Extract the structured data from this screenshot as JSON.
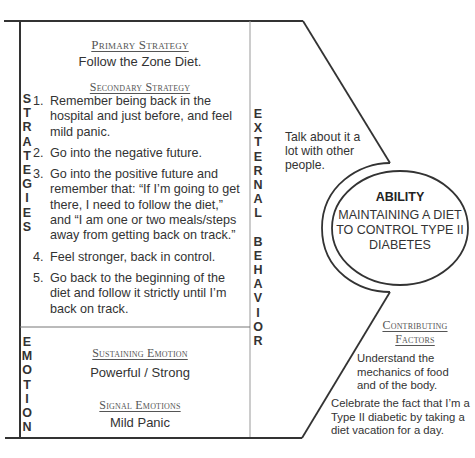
{
  "strategies": {
    "side_label": [
      "S",
      "T",
      "R",
      "A",
      "T",
      "E",
      "G",
      "I",
      "E",
      "S"
    ],
    "primary": {
      "heading": "Primary Strategy",
      "text": "Follow the Zone Diet."
    },
    "secondary": {
      "heading": "Secondary Strategy",
      "steps": [
        {
          "num": "1.",
          "text": "Remember being back in the hospital and just before, and feel mild panic."
        },
        {
          "num": "2.",
          "text": "Go into the negative future."
        },
        {
          "num": "3.",
          "text": "Go into the positive future and remember that: “If I’m going to get there, I need to follow the diet,” and “I am one or two meals/steps away from getting back on track.”"
        },
        {
          "num": "4.",
          "text": "Feel stronger, back in control."
        },
        {
          "num": "5.",
          "text": "Go back to the beginning of the diet and  follow it strictly until I’m back on track."
        }
      ]
    }
  },
  "emotion": {
    "side_label": [
      "E",
      "M",
      "O",
      "T",
      "I",
      "O",
      "N"
    ],
    "sustaining": {
      "heading": "Sustaining Emotion",
      "text": "Powerful / Strong"
    },
    "signal": {
      "heading": "Signal Emotions",
      "text": "Mild Panic"
    }
  },
  "external_behavior": {
    "side_label": [
      "E",
      "X",
      "T",
      "E",
      "R",
      "N",
      "A",
      "L",
      "",
      "B",
      "E",
      "H",
      "A",
      "V",
      "I",
      "O",
      "R"
    ],
    "text": "Talk about it a lot with other people."
  },
  "ability": {
    "title": "ABILITY",
    "text": "MAINTAINING A DIET TO CONTROL TYPE II DIABETES"
  },
  "contributing_factors": {
    "heading_line1": "Contributing",
    "heading_line2": "Factors",
    "items": [
      "Understand the mechanics of food and of the body.",
      "Celebrate the fact that I’m a Type II diabetic by taking a diet vacation for a day."
    ]
  }
}
